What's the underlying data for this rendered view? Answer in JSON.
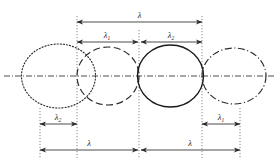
{
  "figure": {
    "type": "technical-line-diagram",
    "title": "",
    "width": 280,
    "height": 163,
    "background_color": "#ffffff",
    "line_color": "#2b2b2b",
    "guide_color": "#555555"
  },
  "axis": {
    "name": "horizontal-centerline",
    "style": "dash-dot",
    "y": 76,
    "x_start": 4,
    "x_end": 276,
    "color": "#3a3a3a"
  },
  "lobes": [
    {
      "id": "lobe-1",
      "label": "",
      "line_style": "dotted",
      "cx": 58.5,
      "cy": 76,
      "rx": 37,
      "ry": 32,
      "color": "#2b2b2b"
    },
    {
      "id": "lobe-2",
      "label": "",
      "line_style": "dashed",
      "cx": 108,
      "cy": 76,
      "rx": 31,
      "ry": 29,
      "color": "#2b2b2b"
    },
    {
      "id": "lobe-3",
      "label": "",
      "line_style": "solid",
      "cx": 170.5,
      "cy": 76,
      "rx": 33,
      "ry": 31,
      "color": "#1a1a1a"
    },
    {
      "id": "lobe-4",
      "label": "",
      "line_style": "dash-dot",
      "cx": 234,
      "cy": 76,
      "rx": 32,
      "ry": 28,
      "color": "#2b2b2b"
    }
  ],
  "guides": [
    {
      "id": "guide-a",
      "x": 40,
      "y_top": 108,
      "y_bottom": 158
    },
    {
      "id": "guide-b",
      "x": 77,
      "y_top": 16,
      "y_bottom": 158
    },
    {
      "id": "guide-c",
      "x": 139,
      "y_top": 30,
      "y_bottom": 158
    },
    {
      "id": "guide-d",
      "x": 202,
      "y_top": 16,
      "y_bottom": 158
    },
    {
      "id": "guide-e",
      "x": 240,
      "y_top": 108,
      "y_bottom": 158
    }
  ],
  "dimensions": [
    {
      "id": "dim-top-lambda",
      "symbol": "λ",
      "subscript": "",
      "x_start": 77,
      "x_end": 202,
      "y": 22,
      "label_x": 139.5,
      "label_y": 18
    },
    {
      "id": "dim-lambda-1-top",
      "symbol": "λ",
      "subscript": "1",
      "x_start": 77,
      "x_end": 138,
      "y": 42,
      "label_x": 107,
      "label_y": 38
    },
    {
      "id": "dim-lambda-2-top",
      "symbol": "λ",
      "subscript": "2",
      "x_start": 141,
      "x_end": 202,
      "y": 42,
      "label_x": 171,
      "label_y": 38
    },
    {
      "id": "dim-lambda-2-bottom-left",
      "symbol": "λ",
      "subscript": "2",
      "x_start": 40,
      "x_end": 77,
      "y": 124,
      "label_x": 58,
      "label_y": 120
    },
    {
      "id": "dim-lambda-1-bottom-right",
      "symbol": "λ",
      "subscript": "1",
      "x_start": 202,
      "x_end": 240,
      "y": 124,
      "label_x": 221,
      "label_y": 120
    },
    {
      "id": "dim-lambda-bottom-left",
      "symbol": "λ",
      "subscript": "",
      "x_start": 40,
      "x_end": 138,
      "y": 150,
      "label_x": 89,
      "label_y": 146
    },
    {
      "id": "dim-lambda-bottom-right",
      "symbol": "λ",
      "subscript": "",
      "x_start": 141,
      "x_end": 240,
      "y": 150,
      "label_x": 190,
      "label_y": 146
    }
  ]
}
